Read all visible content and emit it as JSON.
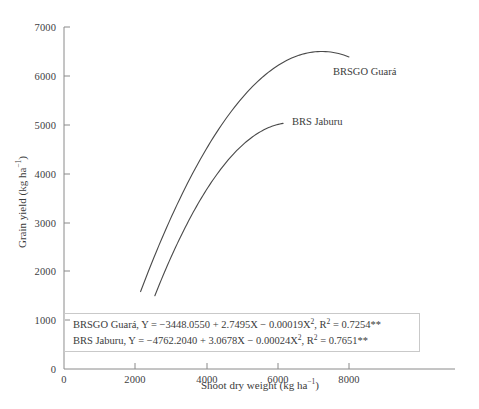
{
  "chart_data": {
    "type": "line",
    "title": "",
    "xlabel": "Shoot dry weight (kg ha⁻¹)",
    "ylabel": "Grain yield (kg ha⁻¹)",
    "xlim": [
      0,
      11000
    ],
    "ylim": [
      0,
      7000
    ],
    "xticks": [
      0,
      2000,
      4000,
      6000,
      8000
    ],
    "xtick_labels": [
      "0",
      "2000",
      "4000",
      "6000",
      "8000"
    ],
    "yticks": [
      0,
      1000,
      2000,
      3000,
      4000,
      5000,
      6000,
      7000
    ],
    "ytick_labels": [
      "0",
      "1000",
      "2000",
      "3000",
      "4000",
      "5000",
      "6000",
      "7000"
    ],
    "grid": false,
    "legend_position": "inline-annotation",
    "line_color": "#4a4a4a",
    "series": [
      {
        "name": "BRSGO Guará",
        "equation": "Y = −3448.0550 + 2.7495X − 0.00019X²",
        "intercept": -3448.055,
        "linear": 2.7495,
        "quadratic": -0.00019,
        "r2": 0.7254,
        "significance": "**",
        "x_range": [
          2150,
          8000
        ],
        "x": [
          2150,
          2600,
          3100,
          3600,
          4100,
          4600,
          5100,
          5600,
          6100,
          6600,
          7100,
          7600,
          8000
        ],
        "values": [
          1580,
          2421,
          3244,
          3998,
          4683,
          5273,
          5797,
          6217,
          6564,
          6806,
          6964,
          7027,
          7000
        ]
      },
      {
        "name": "BRS Jaburu",
        "equation": "Y = −4762.2040 + 3.0678X − 0.00024X²",
        "intercept": -4762.204,
        "linear": 3.0678,
        "quadratic": -0.00024,
        "r2": 0.7651,
        "significance": "**",
        "x_range": [
          2550,
          6150
        ],
        "x": [
          2550,
          3000,
          3500,
          4000,
          4500,
          5000,
          5500,
          6000,
          6150
        ],
        "values": [
          1504,
          2293,
          3092,
          3807,
          4430,
          4969,
          5418,
          5782,
          5875
        ]
      }
    ],
    "annotations": [
      {
        "name": "BRSGO Guará",
        "x": 8150,
        "y": 6000
      },
      {
        "name": "BRS Jaburu",
        "x": 6400,
        "y": 5050
      }
    ]
  },
  "equation_box": {
    "lines": [
      {
        "cultivar": "BRSGO Guará,",
        "eq_prefix": "Y = −3448.0550 + 2.7495X − 0.00019X",
        "eq_sup": "2",
        "eq_suffix": ",",
        "r_label": "R",
        "r_sup": "2",
        "r_value": "= 0.7254**"
      },
      {
        "cultivar": "BRS Jaburu,",
        "eq_prefix": "Y =  −4762.2040 + 3.0678X − 0.00024X",
        "eq_sup": "2",
        "eq_suffix": ",",
        "r_label": "R",
        "r_sup": "2",
        "r_value": "= 0.7651**"
      }
    ]
  },
  "axes": {
    "y_title_main": "Grain yield (kg ha",
    "y_title_sup": "−1",
    "y_title_end": ")",
    "x_title_main": "Shoot dry weight (kg ha",
    "x_title_sup": "−1",
    "x_title_end": ")"
  },
  "series_labels": {
    "guara": "BRSGO Guará",
    "jaburu": "BRS Jaburu"
  }
}
